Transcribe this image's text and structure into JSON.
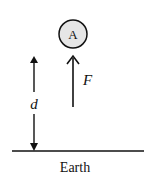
{
  "diagram": {
    "object": {
      "label": "A",
      "fill": "#e6e6e6",
      "stroke": "#111111"
    },
    "force_arrow": {
      "label": "F",
      "direction": "up"
    },
    "distance_arrow": {
      "label": "d",
      "direction": "double"
    },
    "ground": {
      "label": "Earth"
    }
  }
}
